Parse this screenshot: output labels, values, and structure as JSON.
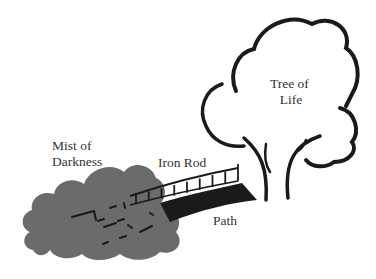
{
  "diagram": {
    "labels": {
      "tree": [
        "Tree of",
        "Life"
      ],
      "mist": [
        "Mist of",
        "Darkness"
      ],
      "rod": "Iron Rod",
      "path": "Path"
    },
    "colors": {
      "mist": "#6b6b6b",
      "ink": "#1a1a1a",
      "text": "#333333",
      "background": "#ffffff"
    },
    "rod_posts_count": 9
  }
}
